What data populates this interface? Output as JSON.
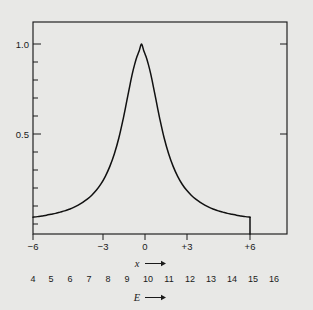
{
  "figure": {
    "background_color": "#e8e8e6",
    "frame_color": "#1a1a1a",
    "curve_color": "#111111"
  },
  "chart_data": {
    "type": "line",
    "title": "",
    "subtitle": "",
    "xlabel": "x",
    "xlabel_display": "x →",
    "ylabel": "",
    "secondary_xlabel": "E",
    "secondary_xlabel_display": "E →",
    "xlim": [
      -6,
      6
    ],
    "ylim": [
      -0.06,
      1.1
    ],
    "grid": false,
    "legend": "none",
    "x_tick_labels": [
      "−6",
      "−3",
      "0",
      "+3",
      "+6"
    ],
    "x_tick_values": [
      -6,
      -3,
      0,
      3,
      6
    ],
    "y_tick_labels": [
      "1.0",
      "0.5"
    ],
    "y_tick_values": [
      1.0,
      0.5
    ],
    "y_minor_tick_values": [
      0.9,
      0.8,
      0.7,
      0.6,
      0.4,
      0.3,
      0.2,
      0.1,
      0.0
    ],
    "secondary_x_tick_labels": [
      "4",
      "5",
      "6",
      "7",
      "8",
      "9",
      "10",
      "11",
      "12",
      "13",
      "14",
      "15",
      "16"
    ],
    "secondary_x_tick_values": [
      4,
      5,
      6,
      7,
      8,
      9,
      10,
      11,
      12,
      13,
      14,
      15,
      16
    ],
    "curve_shape": "lorentzian",
    "peak_x": 0,
    "peak_y": 1.0,
    "fwhm": 2.4,
    "x": [
      -6.0,
      -5.75,
      -5.5,
      -5.25,
      -5.0,
      -4.75,
      -4.5,
      -4.25,
      -4.0,
      -3.75,
      -3.5,
      -3.25,
      -3.0,
      -2.75,
      -2.5,
      -2.25,
      -2.0,
      -1.75,
      -1.5,
      -1.25,
      -1.0,
      -0.875,
      -0.75,
      -0.625,
      -0.5,
      -0.375,
      -0.25,
      -0.125,
      0.0,
      0.125,
      0.25,
      0.375,
      0.5,
      0.625,
      0.75,
      0.875,
      1.0,
      1.25,
      1.5,
      1.75,
      2.0,
      2.25,
      2.5,
      2.75,
      3.0,
      3.25,
      3.5,
      3.75,
      4.0,
      4.25,
      4.5,
      4.75,
      5.0,
      5.25,
      5.5,
      5.75,
      6.0
    ],
    "y": [
      0.038,
      0.041,
      0.045,
      0.049,
      0.054,
      0.059,
      0.066,
      0.073,
      0.082,
      0.092,
      0.105,
      0.12,
      0.138,
      0.16,
      0.187,
      0.221,
      0.265,
      0.32,
      0.39,
      0.479,
      0.59,
      0.652,
      0.716,
      0.779,
      0.838,
      0.888,
      0.93,
      0.963,
      1.0,
      0.963,
      0.93,
      0.888,
      0.838,
      0.779,
      0.716,
      0.652,
      0.59,
      0.479,
      0.39,
      0.32,
      0.265,
      0.221,
      0.187,
      0.16,
      0.138,
      0.12,
      0.105,
      0.092,
      0.082,
      0.073,
      0.066,
      0.059,
      0.054,
      0.049,
      0.045,
      0.041,
      0.038
    ]
  }
}
